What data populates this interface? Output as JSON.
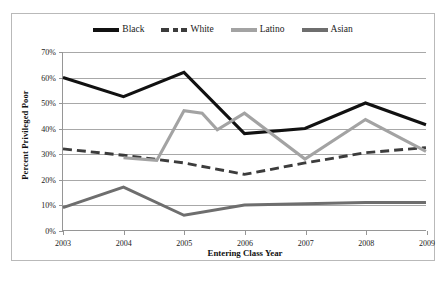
{
  "chart_data": {
    "type": "line",
    "title": "",
    "xlabel": "Entering Class Year",
    "ylabel": "Percent Privileged Poor",
    "categories": [
      "2003",
      "2004",
      "2005",
      "2006",
      "2007",
      "2008",
      "2009"
    ],
    "x": [
      2003,
      2004,
      2005,
      2006,
      2007,
      2008,
      2009
    ],
    "xlim": [
      2003,
      2009
    ],
    "ylim": [
      0,
      70
    ],
    "ytick_labels": [
      "0%",
      "10%",
      "20%",
      "30%",
      "40%",
      "50%",
      "60%",
      "70%"
    ],
    "ytick_values": [
      0,
      10,
      20,
      30,
      40,
      50,
      60,
      70
    ],
    "grid": true,
    "legend_position": "top-center",
    "series": [
      {
        "name": "Black",
        "values": [
          60,
          52.5,
          62,
          38,
          40,
          50,
          41.5
        ],
        "color": "#111111",
        "style": "solid",
        "width": 3.1
      },
      {
        "name": "White",
        "values": [
          32,
          29.5,
          26.5,
          22,
          26.5,
          30.5,
          32.5
        ],
        "color": "#3c3c3c",
        "style": "dashed",
        "width": 2.9
      },
      {
        "name": "Latino",
        "values": [
          null,
          28.5,
          47,
          46,
          28,
          43.5,
          31
        ],
        "color": "#a3a3a3",
        "style": "solid",
        "width": 3.1
      },
      {
        "name": "Asian",
        "values": [
          9,
          17,
          6,
          10,
          10.5,
          11,
          11
        ],
        "color": "#6e6e6e",
        "style": "solid",
        "width": 2.9
      }
    ],
    "annotations": [
      {
        "text": "Latino series dips to 27.5% between 2004 and 2005 before rising",
        "near": 2004.6,
        "value": 27.5
      },
      {
        "text": "Latino series drops to 39.5% shortly after 2006",
        "near": 2006.25,
        "value": 39.5
      }
    ]
  },
  "legend": {
    "entries": [
      {
        "label": "Black",
        "swatch": "solid-black-line-swatch"
      },
      {
        "label": "White",
        "swatch": "dashed-dark-line-swatch"
      },
      {
        "label": "Latino",
        "swatch": "solid-lightgray-line-swatch"
      },
      {
        "label": "Asian",
        "swatch": "solid-gray-line-swatch"
      }
    ]
  },
  "axes": {
    "y_title": "Percent Privileged Poor",
    "x_title": "Entering Class Year"
  }
}
